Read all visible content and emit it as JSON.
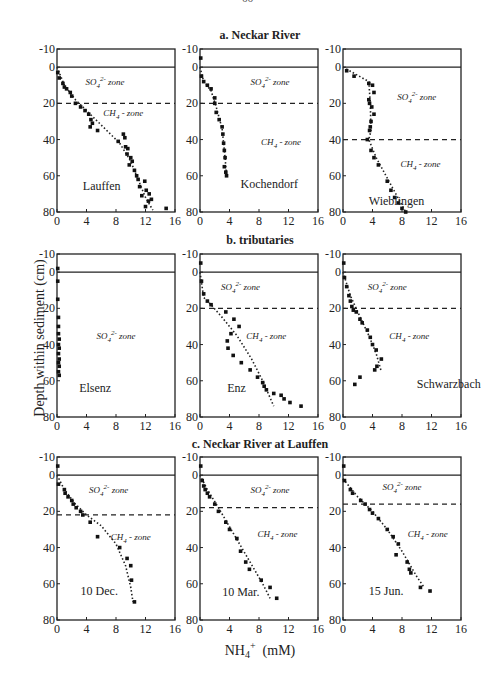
{
  "page_number": "66",
  "figure": {
    "ylabel": "Depth within sediment (cm)",
    "xlabel_main": "NH",
    "xlabel_sub": "4",
    "xlabel_sup": "+",
    "xlabel_unit": "(mM)",
    "sections": [
      {
        "title": "a. Neckar River"
      },
      {
        "title": "b. tributaries"
      },
      {
        "title": "c. Neckar River at Lauffen"
      }
    ]
  },
  "chart_data": [
    {
      "type": "scatter",
      "section": "a. Neckar River",
      "name": "Lauffen",
      "xlabel": "NH4+ (mM)",
      "ylabel": "Depth within sediment (cm)",
      "xlim": [
        0,
        16
      ],
      "ylim": [
        80,
        -10
      ],
      "xticks": [
        0,
        4,
        8,
        12,
        16
      ],
      "yticks": [
        -10,
        0,
        20,
        40,
        60,
        80
      ],
      "sediment_surface": 0,
      "zone_boundary": 20,
      "zones": [
        {
          "label": "SO4 2- zone",
          "x": 6.5,
          "y": 10
        },
        {
          "label": "CH4 - zone",
          "x": 9,
          "y": 27
        }
      ],
      "points": [
        [
          0.1,
          3
        ],
        [
          0.3,
          6
        ],
        [
          0.8,
          9
        ],
        [
          1,
          11
        ],
        [
          1.3,
          12
        ],
        [
          1.8,
          14
        ],
        [
          2,
          16
        ],
        [
          2.5,
          20
        ],
        [
          3.2,
          22
        ],
        [
          3.8,
          24
        ],
        [
          4.3,
          26
        ],
        [
          4.6,
          29
        ],
        [
          4.8,
          31
        ],
        [
          4.5,
          33
        ],
        [
          5.5,
          35
        ],
        [
          8.3,
          41
        ],
        [
          9,
          37
        ],
        [
          9.2,
          39
        ],
        [
          9.3,
          44
        ],
        [
          9.6,
          45
        ],
        [
          9.5,
          48
        ],
        [
          10,
          50
        ],
        [
          10.2,
          52
        ],
        [
          9.8,
          54
        ],
        [
          10.5,
          57
        ],
        [
          10.8,
          60
        ],
        [
          11,
          62
        ],
        [
          11.9,
          63
        ],
        [
          11.2,
          66
        ],
        [
          12.1,
          68
        ],
        [
          12.5,
          70
        ],
        [
          11.5,
          71
        ],
        [
          12.8,
          73
        ],
        [
          12.4,
          74
        ],
        [
          12,
          77
        ],
        [
          14.8,
          78
        ]
      ],
      "trend": [
        [
          0,
          0
        ],
        [
          1,
          10
        ],
        [
          2.5,
          18
        ],
        [
          4,
          24
        ],
        [
          6,
          32
        ],
        [
          8.5,
          42
        ],
        [
          10,
          52
        ],
        [
          11,
          62
        ],
        [
          12,
          72
        ],
        [
          13,
          79
        ]
      ]
    },
    {
      "type": "scatter",
      "section": "a. Neckar River",
      "name": "Kochendorf",
      "xlim": [
        0,
        16
      ],
      "ylim": [
        80,
        -10
      ],
      "xticks": [
        0,
        4,
        8,
        12,
        16
      ],
      "yticks": [
        -10,
        0,
        20,
        40,
        60,
        80
      ],
      "sediment_surface": 0,
      "zone_boundary": 20,
      "zones": [
        {
          "label": "SO4 2- zone",
          "x": 9.5,
          "y": 10
        },
        {
          "label": "CH4 - zone",
          "x": 11,
          "y": 43
        }
      ],
      "points": [
        [
          0.1,
          -5
        ],
        [
          0.2,
          5
        ],
        [
          0.5,
          8
        ],
        [
          1,
          10
        ],
        [
          1.5,
          12
        ],
        [
          2,
          17
        ],
        [
          2,
          20
        ],
        [
          2.2,
          25
        ],
        [
          2.6,
          29
        ],
        [
          3,
          33
        ],
        [
          3.1,
          37
        ],
        [
          3.2,
          42
        ],
        [
          3.3,
          46
        ],
        [
          3.4,
          50
        ],
        [
          3.3,
          55
        ],
        [
          3.5,
          58
        ],
        [
          3.6,
          60
        ]
      ],
      "trend": [
        [
          0,
          0
        ],
        [
          0.5,
          8
        ],
        [
          1.5,
          13
        ],
        [
          2.2,
          22
        ],
        [
          3,
          34
        ],
        [
          3.4,
          50
        ],
        [
          3.6,
          60
        ]
      ]
    },
    {
      "type": "scatter",
      "section": "a. Neckar River",
      "name": "Wieblingen",
      "xlim": [
        0,
        16
      ],
      "ylim": [
        80,
        -10
      ],
      "xticks": [
        0,
        4,
        8,
        12,
        16
      ],
      "yticks": [
        -10,
        0,
        20,
        40,
        60,
        80
      ],
      "sediment_surface": 0,
      "zone_boundary": 40,
      "zones": [
        {
          "label": "SO4 2- zone",
          "x": 10,
          "y": 18
        },
        {
          "label": "CH4 - zone",
          "x": 10.5,
          "y": 55
        }
      ],
      "points": [
        [
          0.5,
          2
        ],
        [
          1.5,
          5
        ],
        [
          3.5,
          9
        ],
        [
          4,
          10
        ],
        [
          4.2,
          14
        ],
        [
          3.5,
          18
        ],
        [
          3.6,
          20
        ],
        [
          3.9,
          22
        ],
        [
          4.2,
          26
        ],
        [
          3.8,
          30
        ],
        [
          3.7,
          33
        ],
        [
          3.6,
          35
        ],
        [
          3.3,
          40
        ],
        [
          3.8,
          46
        ],
        [
          4.2,
          50
        ],
        [
          4.8,
          54
        ],
        [
          6,
          63
        ],
        [
          6.5,
          68
        ],
        [
          7,
          72
        ],
        [
          7.5,
          75
        ],
        [
          8,
          78
        ],
        [
          8.5,
          80
        ]
      ],
      "trend": [
        [
          0,
          0
        ],
        [
          3.5,
          8
        ],
        [
          3.7,
          20
        ],
        [
          3.8,
          35
        ],
        [
          3.5,
          40
        ],
        [
          4.5,
          50
        ],
        [
          6.5,
          65
        ],
        [
          8.5,
          80
        ]
      ]
    },
    {
      "type": "scatter",
      "section": "b. tributaries",
      "name": "Elsenz",
      "xlim": [
        0,
        16
      ],
      "ylim": [
        80,
        -10
      ],
      "xticks": [
        0,
        4,
        8,
        12,
        16
      ],
      "yticks": [
        -10,
        0,
        20,
        40,
        60,
        80
      ],
      "sediment_surface": 0,
      "zones": [
        {
          "label": "SO4 2- zone",
          "x": 8,
          "y": 37
        }
      ],
      "points": [
        [
          0.1,
          -2
        ],
        [
          0.1,
          5
        ],
        [
          0.1,
          15
        ],
        [
          0.2,
          25
        ],
        [
          0.2,
          30
        ],
        [
          0.2,
          34
        ],
        [
          0.3,
          37
        ],
        [
          0.2,
          40
        ],
        [
          0.3,
          42
        ],
        [
          0.2,
          45
        ],
        [
          0.3,
          48
        ],
        [
          0.2,
          50
        ],
        [
          0.3,
          52
        ],
        [
          0.2,
          55
        ],
        [
          0.3,
          57
        ]
      ],
      "trend": []
    },
    {
      "type": "scatter",
      "section": "b. tributaries",
      "name": "Enz",
      "xlim": [
        0,
        16
      ],
      "ylim": [
        80,
        -10
      ],
      "xticks": [
        0,
        4,
        8,
        12,
        16
      ],
      "yticks": [
        -10,
        0,
        20,
        40,
        60,
        80
      ],
      "sediment_surface": 0,
      "zone_boundary": 20,
      "zones": [
        {
          "label": "SO4 2- zone",
          "x": 5.5,
          "y": 10
        },
        {
          "label": "CH4 - zone",
          "x": 9,
          "y": 37
        }
      ],
      "points": [
        [
          0.1,
          -5
        ],
        [
          0.2,
          5
        ],
        [
          0.5,
          12
        ],
        [
          1,
          16
        ],
        [
          1.5,
          18
        ],
        [
          3.5,
          22
        ],
        [
          4.6,
          26
        ],
        [
          5.3,
          30
        ],
        [
          4.2,
          34
        ],
        [
          3.7,
          38
        ],
        [
          3.8,
          42
        ],
        [
          4.5,
          46
        ],
        [
          5.6,
          50
        ],
        [
          6.8,
          54
        ],
        [
          7.8,
          58
        ],
        [
          8.5,
          61
        ],
        [
          8.7,
          63
        ],
        [
          9,
          65
        ],
        [
          10,
          67
        ],
        [
          11,
          68
        ],
        [
          11.4,
          70
        ],
        [
          12.2,
          72
        ],
        [
          13.7,
          74
        ]
      ],
      "trend": [
        [
          0,
          0
        ],
        [
          0.5,
          14
        ],
        [
          1.5,
          18
        ],
        [
          3,
          25
        ],
        [
          5,
          35
        ],
        [
          7,
          48
        ],
        [
          8.5,
          60
        ],
        [
          10,
          74
        ]
      ]
    },
    {
      "type": "scatter",
      "section": "b. tributaries",
      "name": "Schwarzbach",
      "xlim": [
        0,
        16
      ],
      "ylim": [
        80,
        -10
      ],
      "xticks": [
        0,
        4,
        8,
        12,
        16
      ],
      "yticks": [
        -10,
        0,
        20,
        40,
        60,
        80
      ],
      "sediment_surface": 0,
      "zone_boundary": 20,
      "zones": [
        {
          "label": "SO4 2- zone",
          "x": 6,
          "y": 10
        },
        {
          "label": "CH4 - zone",
          "x": 9,
          "y": 37
        }
      ],
      "points": [
        [
          0.1,
          -5
        ],
        [
          0.2,
          3
        ],
        [
          0.5,
          8
        ],
        [
          0.8,
          13
        ],
        [
          1,
          16
        ],
        [
          1.2,
          19
        ],
        [
          1.4,
          21
        ],
        [
          1.8,
          22
        ],
        [
          2.3,
          26
        ],
        [
          2.6,
          28
        ],
        [
          3.3,
          32
        ],
        [
          3.7,
          36
        ],
        [
          4,
          40
        ],
        [
          4.5,
          43
        ],
        [
          5.2,
          48
        ],
        [
          4.6,
          52
        ],
        [
          4.3,
          54
        ],
        [
          2.3,
          58
        ],
        [
          1.6,
          62
        ]
      ],
      "trend": [
        [
          0,
          0
        ],
        [
          1,
          13
        ],
        [
          2,
          22
        ],
        [
          3.5,
          35
        ],
        [
          4.5,
          45
        ],
        [
          5.2,
          55
        ]
      ]
    },
    {
      "type": "scatter",
      "section": "c. Neckar River at Lauffen",
      "name": "10 Dec.",
      "xlim": [
        0,
        16
      ],
      "ylim": [
        80,
        -10
      ],
      "xticks": [
        0,
        4,
        8,
        12,
        16
      ],
      "yticks": [
        -10,
        0,
        20,
        40,
        60,
        80
      ],
      "sediment_surface": 0,
      "zone_boundary": 22,
      "zones": [
        {
          "label": "SO4 2- zone",
          "x": 7,
          "y": 10
        },
        {
          "label": "CH4 - zone",
          "x": 10,
          "y": 36
        }
      ],
      "points": [
        [
          0.1,
          -5
        ],
        [
          0.2,
          5
        ],
        [
          1,
          8
        ],
        [
          1.1,
          10
        ],
        [
          1.5,
          12
        ],
        [
          2,
          14
        ],
        [
          2.2,
          16
        ],
        [
          2.6,
          18
        ],
        [
          3.2,
          20
        ],
        [
          3.5,
          22
        ],
        [
          4.5,
          26
        ],
        [
          5.5,
          34
        ],
        [
          8.5,
          40
        ],
        [
          9.5,
          46
        ],
        [
          10,
          50
        ],
        [
          10.1,
          58
        ],
        [
          10.5,
          70
        ]
      ],
      "trend": [
        [
          0,
          0
        ],
        [
          1,
          8
        ],
        [
          2.5,
          16
        ],
        [
          4,
          22
        ],
        [
          6,
          28
        ],
        [
          8,
          38
        ],
        [
          9.3,
          50
        ],
        [
          10,
          62
        ],
        [
          10.3,
          70
        ]
      ]
    },
    {
      "type": "scatter",
      "section": "c. Neckar River at Lauffen",
      "name": "10 Mar.",
      "xlim": [
        0,
        16
      ],
      "ylim": [
        80,
        -10
      ],
      "xticks": [
        0,
        4,
        8,
        12,
        16
      ],
      "yticks": [
        -10,
        0,
        20,
        40,
        60,
        80
      ],
      "sediment_surface": 0,
      "zone_boundary": 18,
      "zones": [
        {
          "label": "SO4 2- zone",
          "x": 9.5,
          "y": 10
        },
        {
          "label": "CH4 - zone",
          "x": 10.5,
          "y": 34
        }
      ],
      "points": [
        [
          0.1,
          -5
        ],
        [
          0.3,
          3
        ],
        [
          0.5,
          6
        ],
        [
          0.7,
          8
        ],
        [
          1,
          10
        ],
        [
          1.3,
          12
        ],
        [
          2,
          16
        ],
        [
          2.5,
          20
        ],
        [
          3.5,
          26
        ],
        [
          4,
          30
        ],
        [
          5,
          35
        ],
        [
          5.5,
          42
        ],
        [
          6.2,
          48
        ],
        [
          6.7,
          52
        ],
        [
          8.3,
          58
        ],
        [
          9.5,
          62
        ],
        [
          10.4,
          68
        ]
      ],
      "trend": [
        [
          0,
          0
        ],
        [
          1,
          8
        ],
        [
          2.5,
          18
        ],
        [
          4.5,
          32
        ],
        [
          6.5,
          46
        ],
        [
          8.5,
          60
        ],
        [
          9.5,
          68
        ]
      ]
    },
    {
      "type": "scatter",
      "section": "c. Neckar River at Lauffen",
      "name": "15 Jun.",
      "xlim": [
        0,
        16
      ],
      "ylim": [
        80,
        -10
      ],
      "xticks": [
        0,
        4,
        8,
        12,
        16
      ],
      "yticks": [
        -10,
        0,
        20,
        40,
        60,
        80
      ],
      "sediment_surface": 0,
      "zone_boundary": 16,
      "zones": [
        {
          "label": "SO4 2- zone",
          "x": 8,
          "y": 8
        },
        {
          "label": "CH4 - zone",
          "x": 11.5,
          "y": 34
        }
      ],
      "points": [
        [
          0.1,
          -5
        ],
        [
          0.2,
          3
        ],
        [
          1,
          8
        ],
        [
          1.3,
          10
        ],
        [
          2.4,
          14
        ],
        [
          3,
          16
        ],
        [
          3.6,
          19
        ],
        [
          4,
          21
        ],
        [
          4.8,
          24
        ],
        [
          6,
          30
        ],
        [
          6.8,
          34
        ],
        [
          7.5,
          38
        ],
        [
          7.2,
          44
        ],
        [
          8.7,
          48
        ],
        [
          9,
          52
        ],
        [
          9.2,
          54
        ],
        [
          10.5,
          62
        ],
        [
          11.8,
          64
        ]
      ],
      "trend": [
        [
          0,
          2
        ],
        [
          2,
          12
        ],
        [
          4,
          20
        ],
        [
          6,
          30
        ],
        [
          8,
          42
        ],
        [
          10,
          56
        ],
        [
          11,
          62
        ]
      ]
    }
  ]
}
